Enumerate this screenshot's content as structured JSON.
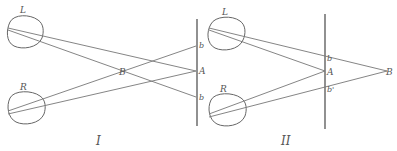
{
  "figures": [
    {
      "id": "I",
      "caption": "I",
      "labels": {
        "left_eye": "L",
        "right_eye": "R",
        "point_B": "B",
        "point_A": "A",
        "point_b_top": "b",
        "point_b_bottom": "b"
      }
    },
    {
      "id": "II",
      "caption": "II",
      "labels": {
        "left_eye": "L",
        "right_eye": "R",
        "point_B": "B",
        "point_A": "A",
        "point_b_top": "b",
        "point_b_bottom": "b'"
      }
    }
  ],
  "colors": {
    "line": "#777777",
    "text": "#555555",
    "background": "#ffffff"
  }
}
